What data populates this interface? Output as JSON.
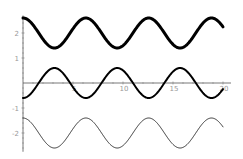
{
  "chart_data": {
    "type": "line",
    "title": "",
    "xlabel": "",
    "ylabel": "",
    "xlim": [
      0,
      20.8
    ],
    "ylim": [
      -2.75,
      2.7
    ],
    "grid": false,
    "legend": null,
    "x_ticks": [
      5,
      10,
      15,
      20
    ],
    "x_tick_labels": [
      "5",
      "10",
      "15",
      "20"
    ],
    "y_ticks": [
      2,
      1,
      -1,
      -2
    ],
    "y_tick_labels": [
      "2",
      "1",
      "-1",
      "-2"
    ],
    "series": [
      {
        "name": "2 + 0.6 cos(x)",
        "formula": "2 + 0.6*cos(x)",
        "offset": 2,
        "amplitude": 0.6,
        "phase_sign": 1,
        "stroke_width": 3,
        "color": "#000000",
        "x": [
          0,
          3.14,
          6.28,
          9.42,
          12.57,
          15.71,
          18.85,
          20
        ],
        "values": [
          2.6,
          1.4,
          2.6,
          1.4,
          2.6,
          1.4,
          2.6,
          2.24
        ]
      },
      {
        "name": "-0.6 cos(x)",
        "formula": "-0.6*cos(x)",
        "offset": 0,
        "amplitude": 0.6,
        "phase_sign": -1,
        "stroke_width": 2,
        "color": "#000000",
        "x": [
          0,
          3.14,
          6.28,
          9.42,
          12.57,
          15.71,
          18.85,
          20
        ],
        "values": [
          -0.6,
          0.6,
          -0.6,
          0.6,
          -0.6,
          0.6,
          -0.6,
          -0.24
        ]
      },
      {
        "name": "-2 + 0.6 cos(x)",
        "formula": "-2 + 0.6*cos(x)",
        "offset": -2,
        "amplitude": 0.6,
        "phase_sign": 1,
        "stroke_width": 1,
        "color": "#333333",
        "x": [
          0,
          3.14,
          6.28,
          9.42,
          12.57,
          15.71,
          18.85,
          20
        ],
        "values": [
          -1.4,
          -2.6,
          -1.4,
          -2.6,
          -1.4,
          -2.6,
          -1.4,
          -1.76
        ]
      }
    ]
  }
}
